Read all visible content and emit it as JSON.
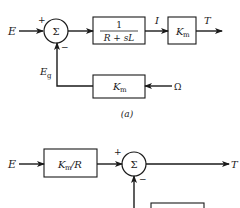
{
  "diagram_a": {
    "input_label": "E",
    "sum_symbol": "Σ",
    "sum_plus": "+",
    "sum_minus": "−",
    "block_transfer": {
      "numerator": "1",
      "denominator": "R + sL"
    },
    "current_label": "I",
    "block_torque_gain": {
      "main": "K",
      "sub": "m"
    },
    "output_label": "T",
    "feedback_label": {
      "main": "E",
      "sub": "g"
    },
    "feedback_block": {
      "main": "K",
      "sub": "m"
    },
    "feedback_input_label": "Ω",
    "caption": "(a)"
  },
  "diagram_b": {
    "input_label": "E",
    "block_gain": {
      "main": "K",
      "sub": "m",
      "suffix": "/R"
    },
    "sum_symbol": "Σ",
    "sum_plus": "+",
    "sum_minus": "−",
    "output_label": "T"
  }
}
